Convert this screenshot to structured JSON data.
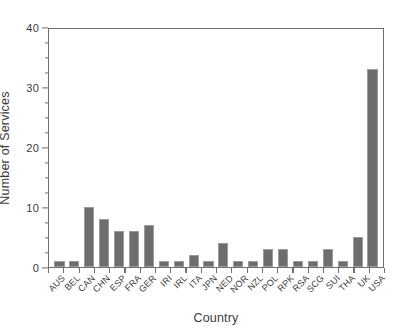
{
  "chart_data": {
    "type": "bar",
    "title": "",
    "xlabel": "Country",
    "ylabel": "Number of Services",
    "ylim": [
      0,
      40
    ],
    "ytick_labels": [
      "0",
      "10",
      "20",
      "30",
      "40"
    ],
    "ytick_values": [
      0,
      10,
      20,
      30,
      40
    ],
    "yminor_interval": 2.5,
    "grid": false,
    "legend": null,
    "bar_color": "#6e6d6d",
    "bar_edge_color": "#9d9c9c",
    "axis_color": "#6f6f6f",
    "categories": [
      "AUS",
      "BEL",
      "CAN",
      "CHN",
      "ESP",
      "FRA",
      "GER",
      "IRI",
      "IRL",
      "ITA",
      "JPN",
      "NED",
      "NOR",
      "NZL",
      "POL",
      "RPK",
      "RSA",
      "SCG",
      "SUI",
      "THA",
      "UK",
      "USA"
    ],
    "values": [
      1,
      1,
      10,
      8,
      6,
      6,
      7,
      1,
      1,
      2,
      1,
      4,
      1,
      1,
      3,
      3,
      1,
      1,
      3,
      1,
      5,
      33
    ]
  }
}
